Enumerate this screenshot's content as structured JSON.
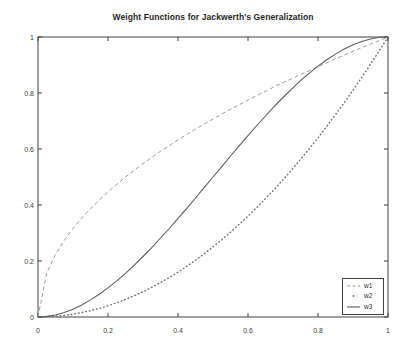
{
  "figure": {
    "title": "Weight Functions for Jackwerth's Generalization"
  },
  "chart_data": {
    "type": "line",
    "title": "Weight Functions for Jackwerth's Generalization",
    "xlabel": "",
    "ylabel": "",
    "xlim": [
      0,
      1
    ],
    "ylim": [
      0,
      1
    ],
    "xticks": [
      0,
      0.2,
      0.4,
      0.6,
      0.8,
      1
    ],
    "yticks": [
      0,
      0.2,
      0.4,
      0.6,
      0.8,
      1
    ],
    "xtick_labels": [
      "0",
      "0.2",
      "0.4",
      "0.6",
      "0.8",
      "1"
    ],
    "ytick_labels": [
      "0",
      "0.2",
      "0.4",
      "0.6",
      "0.8",
      "1"
    ],
    "grid": false,
    "legend": {
      "position": "lower-right",
      "entries": [
        "w1",
        "w2",
        "w3"
      ]
    },
    "x": [
      0,
      0.025,
      0.05,
      0.075,
      0.1,
      0.125,
      0.15,
      0.175,
      0.2,
      0.225,
      0.25,
      0.275,
      0.3,
      0.325,
      0.35,
      0.375,
      0.4,
      0.425,
      0.45,
      0.475,
      0.5,
      0.525,
      0.55,
      0.575,
      0.6,
      0.625,
      0.65,
      0.675,
      0.7,
      0.725,
      0.75,
      0.775,
      0.8,
      0.825,
      0.85,
      0.875,
      0.9,
      0.925,
      0.95,
      0.975,
      1
    ],
    "series": [
      {
        "name": "w1",
        "line_style": "dashed",
        "color": "#9b9b9b",
        "values": [
          0,
          0.158,
          0.224,
          0.274,
          0.316,
          0.354,
          0.387,
          0.418,
          0.447,
          0.474,
          0.5,
          0.524,
          0.548,
          0.57,
          0.592,
          0.612,
          0.632,
          0.652,
          0.671,
          0.689,
          0.707,
          0.725,
          0.742,
          0.758,
          0.775,
          0.791,
          0.806,
          0.822,
          0.837,
          0.851,
          0.866,
          0.88,
          0.894,
          0.908,
          0.922,
          0.935,
          0.949,
          0.962,
          0.975,
          0.987,
          1
        ]
      },
      {
        "name": "w2",
        "line_style": "dotted",
        "color": "#6e6e6e",
        "values": [
          0,
          0.001,
          0.003,
          0.006,
          0.01,
          0.016,
          0.023,
          0.031,
          0.04,
          0.051,
          0.063,
          0.076,
          0.09,
          0.106,
          0.123,
          0.141,
          0.16,
          0.181,
          0.203,
          0.226,
          0.25,
          0.276,
          0.303,
          0.331,
          0.36,
          0.391,
          0.423,
          0.456,
          0.49,
          0.526,
          0.563,
          0.601,
          0.64,
          0.681,
          0.723,
          0.766,
          0.81,
          0.856,
          0.903,
          0.951,
          1
        ]
      },
      {
        "name": "w3",
        "line_style": "solid",
        "color": "#5c5c5c",
        "values": [
          0,
          0.002,
          0.007,
          0.016,
          0.028,
          0.043,
          0.061,
          0.081,
          0.104,
          0.129,
          0.156,
          0.185,
          0.216,
          0.248,
          0.282,
          0.316,
          0.352,
          0.388,
          0.425,
          0.463,
          0.5,
          0.537,
          0.575,
          0.611,
          0.648,
          0.684,
          0.718,
          0.752,
          0.784,
          0.815,
          0.844,
          0.871,
          0.896,
          0.919,
          0.939,
          0.957,
          0.972,
          0.984,
          0.993,
          0.999,
          1
        ]
      }
    ],
    "colors": {
      "axis": "#404040",
      "tick_label": "#3d3d3d",
      "title": "#1f1f1f",
      "background": "#ffffff"
    }
  }
}
